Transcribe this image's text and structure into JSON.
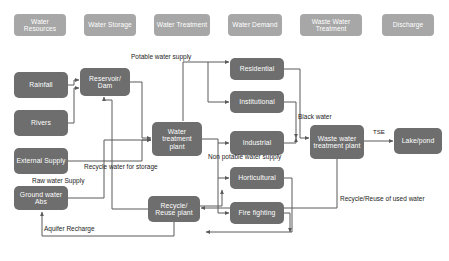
{
  "diagram": {
    "colors": {
      "header_box": "#a7a7a7",
      "process_box": "#6e6e6e",
      "connector": "#5a5a5a",
      "background": "#ffffff",
      "label_text": "#1c1c1c"
    },
    "headers": [
      {
        "label": "Water Resources",
        "x": 14,
        "y": 14,
        "w": 52,
        "h": 22
      },
      {
        "label": "Water Storage",
        "x": 84,
        "y": 14,
        "w": 52,
        "h": 22
      },
      {
        "label": "Water Treatment",
        "x": 154,
        "y": 14,
        "w": 56,
        "h": 22
      },
      {
        "label": "Water Demand",
        "x": 228,
        "y": 14,
        "w": 54,
        "h": 22
      },
      {
        "label": "Waste Water Treatment",
        "x": 300,
        "y": 14,
        "w": 62,
        "h": 22
      },
      {
        "label": "Discharge",
        "x": 382,
        "y": 14,
        "w": 52,
        "h": 22
      }
    ],
    "nodes": [
      {
        "id": "rainfall",
        "label": "Rainfall",
        "x": 14,
        "y": 72,
        "w": 54,
        "h": 26
      },
      {
        "id": "rivers",
        "label": "Rivers",
        "x": 14,
        "y": 110,
        "w": 54,
        "h": 26
      },
      {
        "id": "external",
        "label": "External Supply",
        "x": 14,
        "y": 148,
        "w": 54,
        "h": 26
      },
      {
        "id": "groundwater",
        "label": "Ground water Abs",
        "x": 14,
        "y": 186,
        "w": 54,
        "h": 24
      },
      {
        "id": "reservoir",
        "label": "Reservoir/ Dam",
        "x": 80,
        "y": 68,
        "w": 50,
        "h": 28
      },
      {
        "id": "wtp",
        "label": "Water treatment plant",
        "x": 152,
        "y": 122,
        "w": 50,
        "h": 34
      },
      {
        "id": "recycle",
        "label": "Recycle/ Reuse plant",
        "x": 148,
        "y": 196,
        "w": 52,
        "h": 26
      },
      {
        "id": "residential",
        "label": "Residential",
        "x": 230,
        "y": 58,
        "w": 54,
        "h": 22
      },
      {
        "id": "institutional",
        "label": "Institutional",
        "x": 230,
        "y": 91,
        "w": 54,
        "h": 22
      },
      {
        "id": "industrial",
        "label": "Industrial",
        "x": 230,
        "y": 131,
        "w": 54,
        "h": 24
      },
      {
        "id": "horticultural",
        "label": "Horticultural",
        "x": 230,
        "y": 167,
        "w": 54,
        "h": 22
      },
      {
        "id": "firefighting",
        "label": "Fire fighting",
        "x": 230,
        "y": 202,
        "w": 54,
        "h": 22
      },
      {
        "id": "wwtp",
        "label": "Waste water treatment plant",
        "x": 310,
        "y": 125,
        "w": 54,
        "h": 34
      },
      {
        "id": "lake",
        "label": "Lake/pond",
        "x": 394,
        "y": 128,
        "w": 48,
        "h": 26
      }
    ],
    "annotations": [
      {
        "id": "potable",
        "text": "Potable water supply",
        "x": 131,
        "y": 54
      },
      {
        "id": "non-potable",
        "text": "Non potable water supply",
        "x": 208,
        "y": 154
      },
      {
        "id": "black-water",
        "text": "Black water",
        "x": 298,
        "y": 114
      },
      {
        "id": "tse",
        "text": "TSE",
        "x": 373,
        "y": 129
      },
      {
        "id": "recycle-storage",
        "text": "Recycle water for storage",
        "x": 84,
        "y": 164
      },
      {
        "id": "raw-water",
        "text": "Raw water Supply",
        "x": 32,
        "y": 178
      },
      {
        "id": "aquifer",
        "text": "Aquifer Recharge",
        "x": 44,
        "y": 226
      },
      {
        "id": "reuse-used",
        "text": "Recycle/Reuse of used water",
        "x": 340,
        "y": 196
      }
    ]
  }
}
